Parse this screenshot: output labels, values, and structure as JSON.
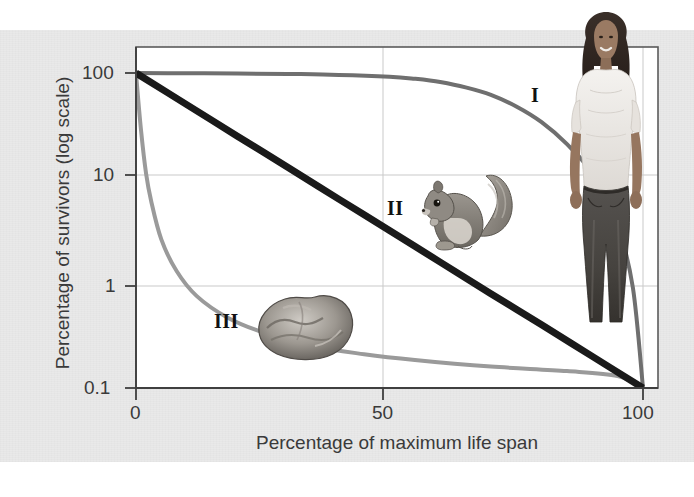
{
  "figure": {
    "background_color": "#e9e9e9",
    "plot_background_color": "#ffffff",
    "frame_color": "#5a5a5a"
  },
  "axes": {
    "y_label": "Percentage of survivors (log scale)",
    "x_label": "Percentage of maximum life span",
    "y_ticks": [
      "100",
      "10",
      "1",
      "0.1"
    ],
    "x_ticks": [
      "0",
      "50",
      "100"
    ]
  },
  "curve_labels": {
    "type_i": "I",
    "type_ii": "II",
    "type_iii": "III"
  },
  "organisms": {
    "human": "human-figure-image",
    "squirrel": "squirrel-image",
    "oyster": "oyster-image"
  },
  "chart_data": {
    "type": "line",
    "title": "",
    "xlabel": "Percentage of maximum life span",
    "ylabel": "Percentage of survivors (log scale)",
    "xlim": [
      0,
      100
    ],
    "ylim": [
      0.1,
      100
    ],
    "yscale": "log",
    "xticks": [
      0,
      50,
      100
    ],
    "yticks": [
      0.1,
      1,
      10,
      100
    ],
    "grid": true,
    "legend": "inline annotations (I, II, III)",
    "series": [
      {
        "name": "I",
        "label": "Type I survivorship (human)",
        "color": "#6f6f6f",
        "width": 3,
        "x": [
          0,
          10,
          20,
          30,
          40,
          50,
          55,
          60,
          65,
          70,
          75,
          80,
          85,
          90,
          95,
          98,
          100
        ],
        "y": [
          100,
          99.5,
          99,
          98,
          96,
          92,
          88,
          82,
          73,
          62,
          48,
          34,
          21,
          11,
          3.5,
          0.9,
          0.1
        ]
      },
      {
        "name": "II",
        "label": "Type II survivorship (squirrel)",
        "color": "#1a1a1a",
        "width": 7,
        "x": [
          0,
          10,
          20,
          30,
          40,
          50,
          60,
          70,
          80,
          90,
          100
        ],
        "y": [
          100,
          50,
          25,
          12.6,
          6.3,
          3.16,
          1.58,
          0.79,
          0.4,
          0.2,
          0.1
        ]
      },
      {
        "name": "III",
        "label": "Type III survivorship (oyster)",
        "color": "#9a9a9a",
        "width": 4,
        "x": [
          0,
          1,
          2,
          3,
          5,
          8,
          12,
          18,
          25,
          35,
          45,
          55,
          70,
          85,
          95,
          100
        ],
        "y": [
          100,
          28,
          11,
          6,
          2.6,
          1.3,
          0.75,
          0.47,
          0.34,
          0.25,
          0.21,
          0.185,
          0.16,
          0.145,
          0.13,
          0.1
        ]
      }
    ]
  }
}
